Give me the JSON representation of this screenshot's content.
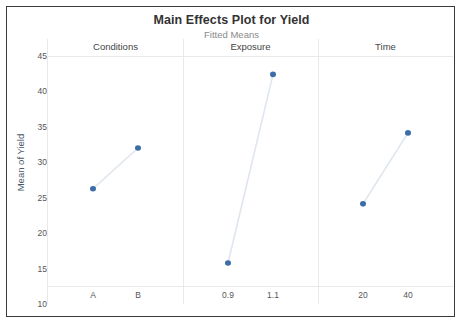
{
  "chart_data": {
    "type": "line",
    "title": "Main Effects Plot for Yield",
    "subtitle": "Fitted Means",
    "ylabel": "Mean of Yield",
    "xlabel": "",
    "ylim": [
      10,
      45
    ],
    "yticks": [
      10,
      15,
      20,
      25,
      30,
      35,
      40,
      45
    ],
    "grid": false,
    "legend": "none",
    "marker_color": "#3b6ea8",
    "line_color": "#dfe6ee",
    "panels": [
      {
        "name": "Conditions",
        "categories": [
          "A",
          "B"
        ],
        "values": [
          24.8,
          31.0
        ]
      },
      {
        "name": "Exposure",
        "categories": [
          "0.9",
          "1.1"
        ],
        "values": [
          13.5,
          42.2
        ]
      },
      {
        "name": "Time",
        "categories": [
          "20",
          "40"
        ],
        "values": [
          22.5,
          33.3
        ]
      }
    ]
  }
}
